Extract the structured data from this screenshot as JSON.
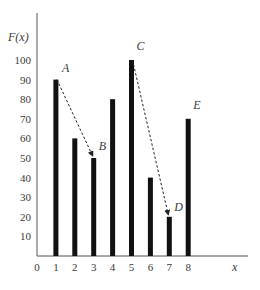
{
  "chart_data": {
    "type": "bar",
    "title": "",
    "xlabel": "x",
    "ylabel": "F(x)",
    "categories": [
      "1",
      "2",
      "3",
      "4",
      "5",
      "6",
      "7",
      "8"
    ],
    "values": [
      90,
      60,
      50,
      80,
      100,
      40,
      20,
      70
    ],
    "ylim": [
      0,
      110
    ],
    "xlim": [
      0,
      10
    ],
    "yticks": [
      10,
      20,
      30,
      40,
      50,
      60,
      70,
      80,
      90,
      100
    ],
    "xticks": [
      0,
      1,
      2,
      3,
      4,
      5,
      6,
      7,
      8
    ],
    "grid": false,
    "legend": null,
    "annotations": [
      {
        "label": "A",
        "x": 1,
        "y": 90
      },
      {
        "label": "B",
        "x": 3,
        "y": 50
      },
      {
        "label": "C",
        "x": 5,
        "y": 100
      },
      {
        "label": "D",
        "x": 7,
        "y": 20
      },
      {
        "label": "E",
        "x": 8,
        "y": 70
      }
    ],
    "arrows": [
      {
        "from": "A",
        "to": "B",
        "style": "dashed"
      },
      {
        "from": "C",
        "to": "D",
        "style": "dashed"
      }
    ]
  },
  "style": {
    "bar_color": "#111111",
    "axis_color": "#555555",
    "text_color": "#3a3a3a"
  }
}
